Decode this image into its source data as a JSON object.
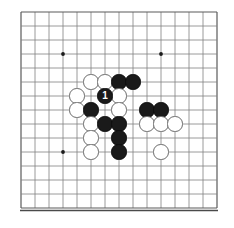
{
  "figure": {
    "name": "go-board-diagram",
    "type": "go-board",
    "board_size": 15,
    "grid": {
      "origin_x": 21,
      "origin_y": 12,
      "spacing": 14,
      "line_color": "#808080",
      "border_color": "#5a5a5a",
      "background_color": "#ffffff",
      "star_point_color": "#1a1a1a"
    },
    "stone_radius": 7.6,
    "colors": {
      "black_stone": "#1a1a1a",
      "white_stone": "#ffffff",
      "white_stone_edge": "#6a6a6a",
      "label_text": "#ffffff"
    }
  },
  "star_points": [
    {
      "col": 3,
      "row": 3
    },
    {
      "col": 10,
      "row": 3
    },
    {
      "col": 3,
      "row": 10
    },
    {
      "col": 10,
      "row": 10
    }
  ],
  "stones": [
    {
      "color": "white",
      "col": 5,
      "row": 5,
      "label": ""
    },
    {
      "color": "white",
      "col": 6,
      "row": 5,
      "label": ""
    },
    {
      "color": "black",
      "col": 7,
      "row": 5,
      "label": ""
    },
    {
      "color": "black",
      "col": 8,
      "row": 5,
      "label": ""
    },
    {
      "color": "white",
      "col": 4,
      "row": 6,
      "label": ""
    },
    {
      "color": "black",
      "col": 6,
      "row": 6,
      "label": "1"
    },
    {
      "color": "white",
      "col": 7,
      "row": 6,
      "label": ""
    },
    {
      "color": "white",
      "col": 4,
      "row": 7,
      "label": ""
    },
    {
      "color": "black",
      "col": 5,
      "row": 7,
      "label": ""
    },
    {
      "color": "white",
      "col": 7,
      "row": 7,
      "label": ""
    },
    {
      "color": "black",
      "col": 9,
      "row": 7,
      "label": ""
    },
    {
      "color": "black",
      "col": 10,
      "row": 7,
      "label": ""
    },
    {
      "color": "white",
      "col": 5,
      "row": 8,
      "label": ""
    },
    {
      "color": "black",
      "col": 6,
      "row": 8,
      "label": ""
    },
    {
      "color": "black",
      "col": 7,
      "row": 8,
      "label": ""
    },
    {
      "color": "white",
      "col": 9,
      "row": 8,
      "label": ""
    },
    {
      "color": "white",
      "col": 10,
      "row": 8,
      "label": ""
    },
    {
      "color": "white",
      "col": 11,
      "row": 8,
      "label": ""
    },
    {
      "color": "white",
      "col": 5,
      "row": 9,
      "label": ""
    },
    {
      "color": "black",
      "col": 7,
      "row": 9,
      "label": ""
    },
    {
      "color": "white",
      "col": 5,
      "row": 10,
      "label": ""
    },
    {
      "color": "black",
      "col": 7,
      "row": 10,
      "label": ""
    },
    {
      "color": "white",
      "col": 10,
      "row": 10,
      "label": ""
    }
  ]
}
